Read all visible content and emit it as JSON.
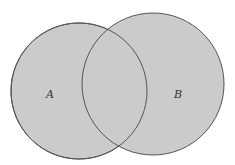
{
  "diagram": {
    "type": "venn",
    "fill_color": "#cbcbcb",
    "stroke_color": "#555555",
    "sets": [
      {
        "id": "A",
        "label": "A",
        "cx": 79,
        "cy": 91,
        "r": 68,
        "label_x": 50,
        "label_y": 98
      },
      {
        "id": "B",
        "label": "B",
        "cx": 153,
        "cy": 84,
        "r": 71,
        "label_x": 178,
        "label_y": 98
      }
    ]
  }
}
